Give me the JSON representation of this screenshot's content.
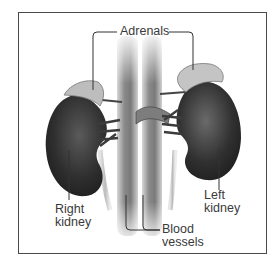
{
  "figure": {
    "labels": {
      "adrenals": "Adrenals",
      "right_kidney": {
        "line1": "Right",
        "line2": "kidney"
      },
      "left_kidney": {
        "line1": "Left",
        "line2": "kidney"
      },
      "blood_vessels": {
        "line1": "Blood",
        "line2": "vessels"
      }
    },
    "colors": {
      "frame": "#4a4a4a",
      "kidney": "#2e2e2e",
      "adrenal": "#bdbdbd",
      "vessel": "#8c8c8c",
      "leader_line": "#333333",
      "text": "#3a3a3a"
    }
  }
}
